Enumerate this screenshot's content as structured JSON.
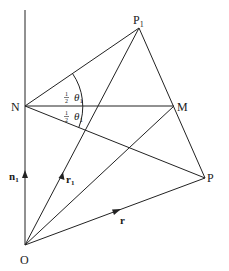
{
  "diagram": {
    "points": {
      "P1": {
        "label": "P",
        "sub": "1",
        "x": 139,
        "y": 28
      },
      "N": {
        "label": "N",
        "x": 25,
        "y": 106
      },
      "M": {
        "label": "M",
        "x": 174,
        "y": 106
      },
      "P": {
        "label": "P",
        "x": 205,
        "y": 178
      },
      "O": {
        "label": "O",
        "x": 25,
        "y": 245
      }
    },
    "vectors": {
      "n1": {
        "label": "n",
        "sub": "1"
      },
      "r1": {
        "label": "r",
        "sub": "1"
      },
      "r": {
        "label": "r"
      }
    },
    "angles": {
      "upper": {
        "frac_num": "1",
        "frac_den": "2",
        "symbol": "θ",
        "sub": "1"
      },
      "lower": {
        "frac_num": "1",
        "frac_den": "2",
        "symbol": "θ",
        "sub": "1"
      }
    },
    "color": "#222222"
  }
}
